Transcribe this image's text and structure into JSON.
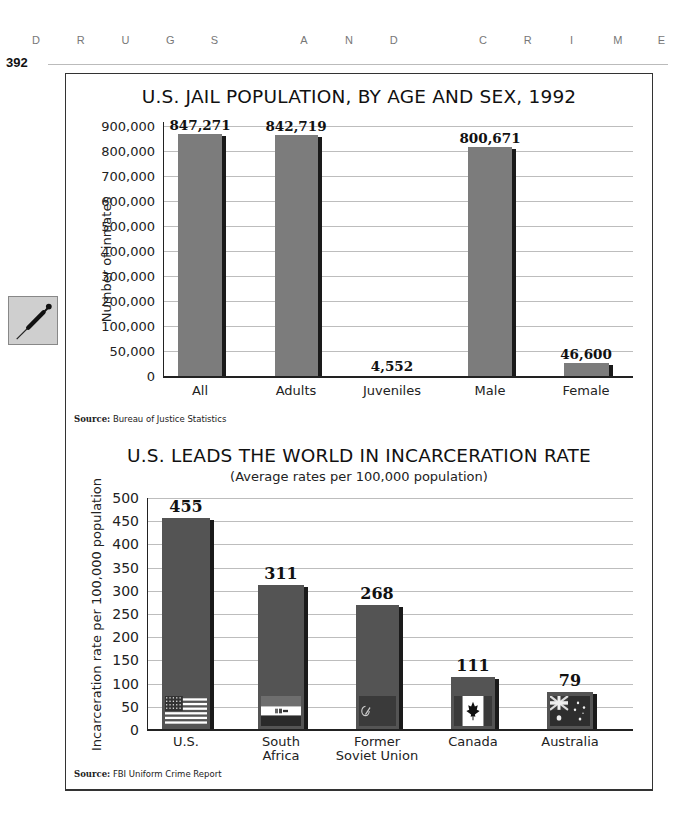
{
  "page": {
    "running_head": [
      "D",
      "R",
      "U",
      "G",
      "S",
      " ",
      "A",
      "N",
      "D",
      " ",
      "C",
      "R",
      "I",
      "M",
      "E"
    ],
    "page_number": "392",
    "side_icon": "syringe-icon"
  },
  "chart_data": [
    {
      "type": "bar",
      "title": "U.S. JAIL POPULATION, BY AGE AND SEX, 1992",
      "xlabel": "",
      "ylabel": "Number of inmates",
      "categories": [
        "All",
        "Adults",
        "Juveniles",
        "Male",
        "Female"
      ],
      "values": [
        847271,
        842719,
        4552,
        800671,
        46600
      ],
      "value_labels": [
        "847,271",
        "842,719",
        "4,552",
        "800,671",
        "46,600"
      ],
      "ytick_labels": [
        "0",
        "50,000",
        "100,000",
        "200,000",
        "300,000",
        "400,000",
        "500,000",
        "600,000",
        "700,000",
        "800,000",
        "900,000"
      ],
      "ylim": [
        0,
        900000
      ],
      "grid": true,
      "legend": null,
      "bar_color": "#7c7c7c",
      "source_label": "Source:",
      "source": "Bureau of Justice Statistics"
    },
    {
      "type": "bar",
      "title": "U.S. LEADS THE WORLD IN INCARCERATION RATE",
      "subtitle": "(Average rates per 100,000 population)",
      "xlabel": "",
      "ylabel": "Incarceration rate per 100,000 population",
      "categories": [
        "U.S.",
        "South Africa",
        "Former Soviet Union",
        "Canada",
        "Australia"
      ],
      "category_lines": [
        [
          "U.S."
        ],
        [
          "South",
          "Africa"
        ],
        [
          "Former",
          "Soviet Union"
        ],
        [
          "Canada"
        ],
        [
          "Australia"
        ]
      ],
      "values": [
        455,
        311,
        268,
        111,
        79
      ],
      "value_labels": [
        "455",
        "311",
        "268",
        "111",
        "79"
      ],
      "flags": [
        "us-flag-icon",
        "south-africa-flag-icon",
        "soviet-flag-icon",
        "canada-flag-icon",
        "australia-flag-icon"
      ],
      "ytick_labels": [
        "0",
        "50",
        "100",
        "150",
        "200",
        "250",
        "300",
        "350",
        "400",
        "450",
        "500"
      ],
      "ylim": [
        0,
        500
      ],
      "grid": true,
      "legend": null,
      "bar_color": "#545454",
      "source_label": "Source:",
      "source": "FBI Uniform Crime Report"
    }
  ]
}
